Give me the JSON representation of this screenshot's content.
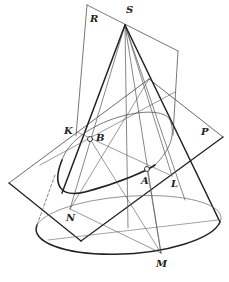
{
  "figure": {
    "type": "cone-plane-section",
    "colors": {
      "stroke": "#2a2a2a",
      "thin": "#555555",
      "background": "#ffffff"
    },
    "labels": [
      {
        "id": "S",
        "text": "S",
        "x": 126,
        "y": 5
      },
      {
        "id": "R",
        "text": "R",
        "x": 90,
        "y": 14
      },
      {
        "id": "P",
        "text": "P",
        "x": 201,
        "y": 127
      },
      {
        "id": "K",
        "text": "K",
        "x": 64,
        "y": 126
      },
      {
        "id": "B",
        "text": "B",
        "x": 96,
        "y": 133
      },
      {
        "id": "A",
        "text": "A",
        "x": 141,
        "y": 176
      },
      {
        "id": "L",
        "text": "L",
        "x": 171,
        "y": 179
      },
      {
        "id": "N",
        "text": "N",
        "x": 66,
        "y": 213
      },
      {
        "id": "M",
        "text": "M",
        "x": 156,
        "y": 259
      }
    ],
    "points": {
      "S": [
        125,
        25
      ],
      "K": [
        77,
        132
      ],
      "B": [
        90,
        139
      ],
      "A": [
        147,
        169
      ],
      "L": [
        172,
        176
      ],
      "N": [
        70,
        209
      ],
      "M": [
        161,
        253
      ]
    }
  }
}
